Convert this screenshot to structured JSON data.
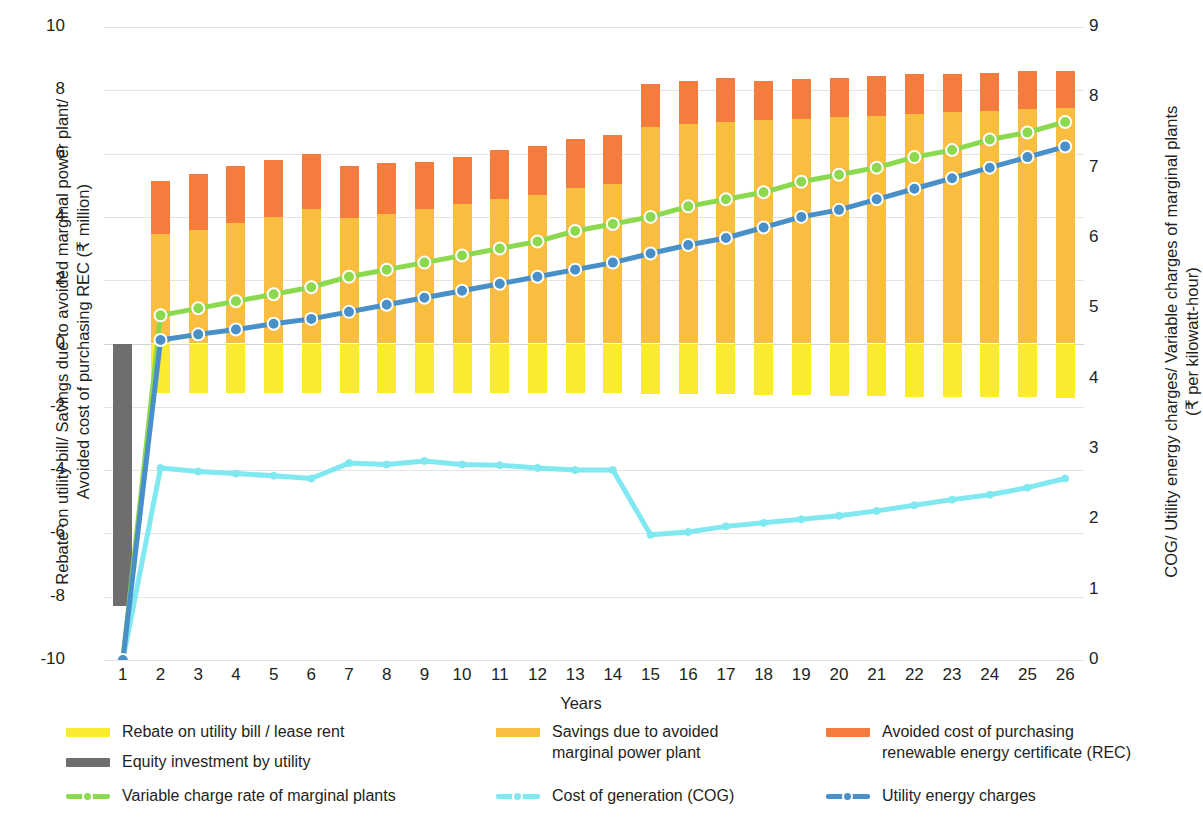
{
  "axes": {
    "y_left_title": "Rebate on utility bill/ Savings due to avoided marginal power plant/\nAvoided cost of purchasing REC (₹ million)",
    "y_right_title": "COG/ Utility energy charges/ Variable charges of marginal plants\n(₹ per kilowatt-hour)",
    "x_title": "Years"
  },
  "legend": {
    "items": [
      {
        "label": "Rebate on utility bill / lease rent",
        "color": "#FAEA30",
        "kind": "bar"
      },
      {
        "label": "Savings due to avoided\nmarginal power plant",
        "color": "#F9BE40",
        "kind": "bar"
      },
      {
        "label": "Avoided cost of purchasing\nrenewable energy certificate (REC)",
        "color": "#F47C3C",
        "kind": "bar"
      },
      {
        "label": "Equity investment by utility",
        "color": "#6E6E6E",
        "kind": "bar"
      },
      {
        "label": "Variable charge rate of marginal plants",
        "color": "#8CD94F",
        "kind": "line"
      },
      {
        "label": "Cost of generation (COG)",
        "color": "#7FE8F0",
        "kind": "line"
      },
      {
        "label": "Utility energy charges",
        "color": "#4A90C8",
        "kind": "line"
      }
    ]
  },
  "chart_data": {
    "type": "bar",
    "title": "",
    "xlabel": "Years",
    "ylabel": "Rebate on utility bill/ Savings due to avoided marginal power plant/ Avoided cost of purchasing REC (₹ million)",
    "y2label": "COG/ Utility energy charges/ Variable charges of marginal plants (₹ per kilowatt-hour)",
    "ylim": [
      -10,
      10
    ],
    "y2lim": [
      0,
      9
    ],
    "yticks": [
      10,
      8,
      6,
      4,
      2,
      0,
      -2,
      -4,
      -6,
      -8,
      -10
    ],
    "y2ticks": [
      9,
      8,
      7,
      6,
      5,
      4,
      3,
      2,
      1,
      0
    ],
    "grid": true,
    "legend_position": "bottom",
    "categories": [
      1,
      2,
      3,
      4,
      5,
      6,
      7,
      8,
      9,
      10,
      11,
      12,
      13,
      14,
      15,
      16,
      17,
      18,
      19,
      20,
      21,
      22,
      23,
      24,
      25,
      26
    ],
    "series": [
      {
        "name": "Rebate on utility bill / lease rent",
        "type": "bar",
        "stack": "neg",
        "axis": "left",
        "color": "#FAEA30",
        "values": [
          0,
          -1.55,
          -1.55,
          -1.55,
          -1.55,
          -1.55,
          -1.55,
          -1.55,
          -1.55,
          -1.55,
          -1.55,
          -1.55,
          -1.55,
          -1.55,
          -1.6,
          -1.6,
          -1.6,
          -1.62,
          -1.62,
          -1.65,
          -1.65,
          -1.68,
          -1.68,
          -1.7,
          -1.7,
          -1.72
        ]
      },
      {
        "name": "Savings due to avoided marginal power plant",
        "type": "bar",
        "stack": "pos",
        "axis": "left",
        "color": "#F9BE40",
        "values": [
          0,
          3.45,
          3.6,
          3.8,
          4.0,
          4.25,
          3.95,
          4.1,
          4.25,
          4.4,
          4.55,
          4.7,
          4.9,
          5.05,
          6.85,
          6.95,
          7.0,
          7.05,
          7.1,
          7.15,
          7.2,
          7.25,
          7.3,
          7.35,
          7.4,
          7.45
        ]
      },
      {
        "name": "Avoided cost of purchasing renewable energy certificate (REC)",
        "type": "bar",
        "stack": "pos",
        "axis": "left",
        "color": "#F47C3C",
        "values": [
          0,
          1.7,
          1.75,
          1.8,
          1.8,
          1.75,
          1.65,
          1.6,
          1.5,
          1.5,
          1.55,
          1.55,
          1.55,
          1.55,
          1.35,
          1.35,
          1.4,
          1.25,
          1.25,
          1.25,
          1.25,
          1.25,
          1.2,
          1.2,
          1.2,
          1.15
        ]
      },
      {
        "name": "Equity investment by utility",
        "type": "bar",
        "stack": "neg",
        "axis": "left",
        "color": "#6E6E6E",
        "values": [
          -8.3,
          0,
          0,
          0,
          0,
          0,
          0,
          0,
          0,
          0,
          0,
          0,
          0,
          0,
          0,
          0,
          0,
          0,
          0,
          0,
          0,
          0,
          0,
          0,
          0,
          0
        ]
      },
      {
        "name": "Variable charge rate of marginal plants",
        "type": "line",
        "axis": "right",
        "color": "#8CD94F",
        "values": [
          0.0,
          4.9,
          5.0,
          5.1,
          5.2,
          5.3,
          5.45,
          5.55,
          5.65,
          5.75,
          5.85,
          5.95,
          6.1,
          6.2,
          6.3,
          6.45,
          6.55,
          6.65,
          6.8,
          6.9,
          7.0,
          7.15,
          7.25,
          7.4,
          7.5,
          7.65
        ]
      },
      {
        "name": "Cost of generation (COG)",
        "type": "line",
        "axis": "right",
        "color": "#7FE8F0",
        "values": [
          0.0,
          2.73,
          2.68,
          2.65,
          2.62,
          2.58,
          2.8,
          2.78,
          2.83,
          2.78,
          2.77,
          2.73,
          2.7,
          2.7,
          1.78,
          1.82,
          1.9,
          1.95,
          2.0,
          2.05,
          2.12,
          2.2,
          2.28,
          2.35,
          2.45,
          2.58
        ]
      },
      {
        "name": "Utility energy charges",
        "type": "line",
        "axis": "right",
        "color": "#4A90C8",
        "values": [
          0.0,
          4.55,
          4.63,
          4.7,
          4.78,
          4.85,
          4.95,
          5.05,
          5.15,
          5.25,
          5.35,
          5.45,
          5.55,
          5.65,
          5.78,
          5.9,
          6.0,
          6.15,
          6.3,
          6.4,
          6.55,
          6.7,
          6.85,
          7.0,
          7.15,
          7.3
        ]
      }
    ]
  }
}
